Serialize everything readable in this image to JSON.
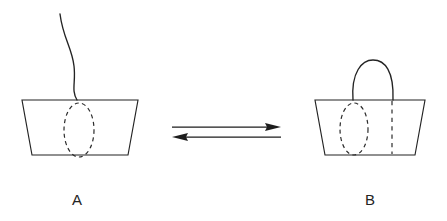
{
  "figure": {
    "type": "reaction-equilibrium-schematic",
    "background_color": "#ffffff",
    "ink_color": "#232323",
    "states": [
      {
        "id": "A",
        "label": "A",
        "label_x": 72,
        "label_y": 205,
        "description": "Open basket with slack hanging string and one dashed ellipse",
        "container_shape": "trapezoid",
        "container": {
          "top_left_x": 22,
          "top_right_x": 138,
          "top_y": 100,
          "bottom_left_x": 32,
          "bottom_right_x": 128,
          "bottom_y": 155
        },
        "handle": {
          "state": "slack-open-strand",
          "path": "M 60 14 C 63 38, 72 48, 74 66 C 76 82, 71 90, 77 100"
        },
        "dashed_marks": [
          {
            "name": "dashed-ellipse",
            "shape": "ellipse",
            "cx": 79,
            "cy": 130,
            "rx": 15,
            "ry": 27
          }
        ]
      },
      {
        "id": "B",
        "label": "B",
        "label_x": 365,
        "label_y": 205,
        "description": "Closed basket with arched handle, one dashed ellipse and one dashed vertical line",
        "container_shape": "trapezoid",
        "container": {
          "top_left_x": 315,
          "top_right_x": 425,
          "top_y": 100,
          "bottom_left_x": 325,
          "bottom_right_x": 415,
          "bottom_y": 155
        },
        "handle": {
          "state": "closed-arch",
          "path": "M 353 100 C 351 72, 362 60, 373 60 C 385 60, 394 71, 393 100"
        },
        "dashed_marks": [
          {
            "name": "dashed-ellipse",
            "shape": "ellipse",
            "cx": 354,
            "cy": 129,
            "rx": 14,
            "ry": 26
          },
          {
            "name": "dashed-vertical-line",
            "shape": "line",
            "x": 392,
            "y1": 101,
            "y2": 154
          }
        ]
      }
    ],
    "equilibrium_arrows": {
      "name": "equilibrium-arrows",
      "symbol": "reversible-reaction",
      "forward": {
        "direction": "right",
        "x_start": 172,
        "x_end": 281,
        "y": 127
      },
      "reverse": {
        "direction": "left",
        "x_start": 281,
        "x_end": 172,
        "y": 137
      }
    }
  }
}
